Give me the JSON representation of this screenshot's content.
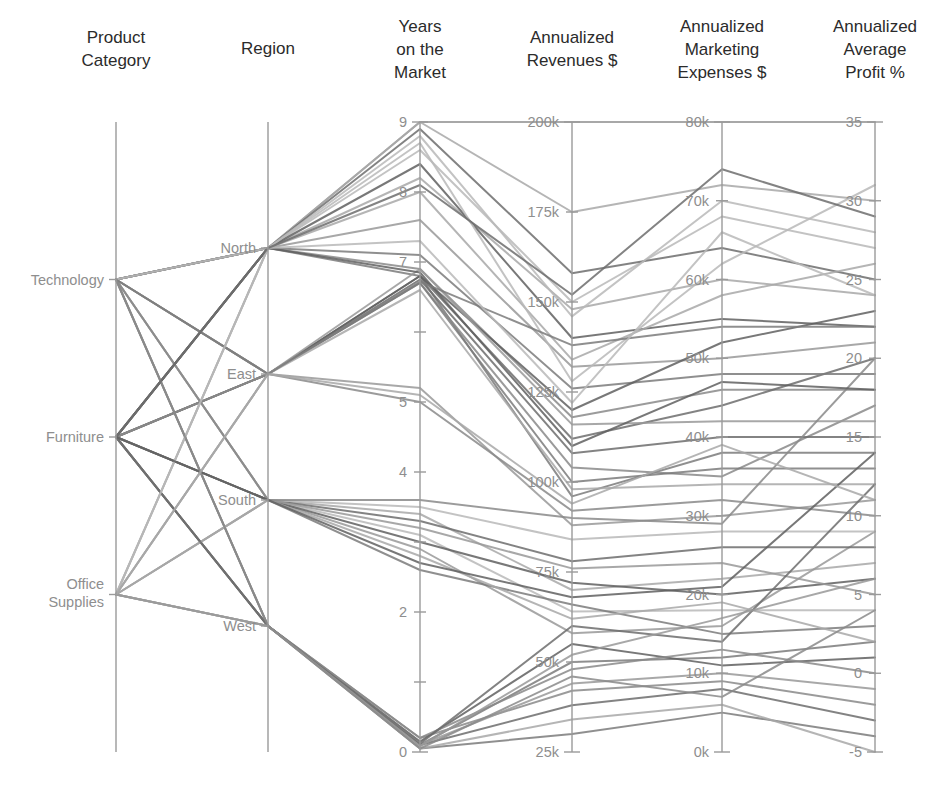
{
  "figure": {
    "type": "parallel-coordinates",
    "background": "#ffffff",
    "width": 935,
    "height": 794
  },
  "axes": [
    {
      "id": "product-category",
      "title_lines": [
        "Product",
        "Category"
      ],
      "scale": "categorical",
      "categories": [
        "Technology",
        "Furniture",
        "Office Supplies"
      ],
      "x": 116,
      "top": 122,
      "bottom": 752
    },
    {
      "id": "region",
      "title_lines": [
        "Region"
      ],
      "scale": "categorical",
      "categories": [
        "North",
        "East",
        "South",
        "West"
      ],
      "x": 268,
      "top": 122,
      "bottom": 752
    },
    {
      "id": "years-on-market",
      "title_lines": [
        "Years",
        "on the",
        "Market"
      ],
      "scale": "numeric",
      "min": 0,
      "max": 9,
      "ticks": [
        0,
        1,
        2,
        3,
        4,
        5,
        6,
        7,
        8,
        9
      ],
      "tick_labels": [
        "0",
        "",
        "2",
        "",
        "4",
        "5",
        "",
        "7",
        "8",
        "9"
      ],
      "x": 420,
      "top": 122,
      "bottom": 752
    },
    {
      "id": "annualized-revenues",
      "title_lines": [
        "Annualized",
        "Revenues $"
      ],
      "scale": "numeric",
      "min": 25000,
      "max": 200000,
      "ticks": [
        25000,
        50000,
        75000,
        100000,
        125000,
        150000,
        175000,
        200000
      ],
      "tick_labels": [
        "25k",
        "50k",
        "75k",
        "100k",
        "125k",
        "150k",
        "175k",
        "200k"
      ],
      "x": 572,
      "top": 122,
      "bottom": 752
    },
    {
      "id": "annualized-marketing-expenses",
      "title_lines": [
        "Annualized",
        "Marketing",
        "Expenses $"
      ],
      "scale": "numeric",
      "min": 0,
      "max": 80000,
      "ticks": [
        0,
        10000,
        20000,
        30000,
        40000,
        50000,
        60000,
        70000,
        80000
      ],
      "tick_labels": [
        "0k",
        "10k",
        "20k",
        "30k",
        "40k",
        "50k",
        "60k",
        "70k",
        "80k"
      ],
      "x": 722,
      "top": 122,
      "bottom": 752
    },
    {
      "id": "annualized-average-profit",
      "title_lines": [
        "Annualized",
        "Average",
        "Profit %"
      ],
      "scale": "numeric",
      "min": -5,
      "max": 35,
      "ticks": [
        -5,
        0,
        5,
        10,
        15,
        20,
        25,
        30,
        35
      ],
      "tick_labels": [
        "-5",
        "0",
        "5",
        "10",
        "15",
        "20",
        "25",
        "30",
        "35"
      ],
      "x": 875,
      "top": 122,
      "bottom": 752
    }
  ],
  "style": {
    "axis_color": "#9a9a9a",
    "tick_label_color": "#8e8e8e",
    "title_color": "#2b2b2b",
    "line_colors": [
      "#b8b8b8",
      "#a8a8a8",
      "#999999",
      "#8a8a8a",
      "#7b7b7b",
      "#6d6d6d",
      "#606060"
    ],
    "line_width": 2.0,
    "line_opacity": 0.85
  },
  "chart_data": {
    "type": "line",
    "title": "",
    "dimensions": [
      "Product Category",
      "Region",
      "Years on the Market",
      "Annualized Revenues $",
      "Annualized Marketing Expenses $",
      "Annualized Average Profit %"
    ],
    "categorical_domains": {
      "Product Category": [
        "Technology",
        "Furniture",
        "Office Supplies"
      ],
      "Region": [
        "North",
        "East",
        "South",
        "West"
      ]
    },
    "axis_ranges": {
      "Years on the Market": [
        0,
        9
      ],
      "Annualized Revenues $": [
        25000,
        200000
      ],
      "Annualized Marketing Expenses $": [
        0,
        80000
      ],
      "Annualized Average Profit %": [
        -5,
        35
      ]
    },
    "legend": "none",
    "grid": false,
    "records": [
      {
        "category": "Technology",
        "region": "North",
        "years": 9,
        "revenues": 200000,
        "marketing": 80000,
        "profit": 35,
        "shade": 2
      },
      {
        "category": "Technology",
        "region": "North",
        "years": 9,
        "revenues": 175000,
        "marketing": 72000,
        "profit": 30,
        "shade": 1
      },
      {
        "category": "Technology",
        "region": "North",
        "years": 8.6,
        "revenues": 150000,
        "marketing": 68000,
        "profit": 27,
        "shade": 0
      },
      {
        "category": "Technology",
        "region": "North",
        "years": 8.2,
        "revenues": 148000,
        "marketing": 60000,
        "profit": 24,
        "shade": 1
      },
      {
        "category": "Technology",
        "region": "North",
        "years": 7.6,
        "revenues": 132000,
        "marketing": 50000,
        "profit": 21,
        "shade": 2
      },
      {
        "category": "Technology",
        "region": "North",
        "years": 6.9,
        "revenues": 118000,
        "marketing": 46000,
        "profit": 18,
        "shade": 3
      },
      {
        "category": "Technology",
        "region": "North",
        "years": 6.8,
        "revenues": 96000,
        "marketing": 38000,
        "profit": 14,
        "shade": 4
      },
      {
        "category": "Technology",
        "region": "East",
        "years": 6.8,
        "revenues": 112000,
        "marketing": 44000,
        "profit": 20,
        "shade": 5
      },
      {
        "category": "Technology",
        "region": "East",
        "years": 6.7,
        "revenues": 104000,
        "marketing": 35000,
        "profit": 17,
        "shade": 3
      },
      {
        "category": "Technology",
        "region": "East",
        "years": 5.2,
        "revenues": 88000,
        "marketing": 30000,
        "profit": 11,
        "shade": 2
      },
      {
        "category": "Technology",
        "region": "South",
        "years": 3.4,
        "revenues": 70000,
        "marketing": 22000,
        "profit": 7,
        "shade": 1
      },
      {
        "category": "Technology",
        "region": "South",
        "years": 3.1,
        "revenues": 64000,
        "marketing": 18000,
        "profit": 4,
        "shade": 0
      },
      {
        "category": "Technology",
        "region": "South",
        "years": 2.9,
        "revenues": 58000,
        "marketing": 16000,
        "profit": 9,
        "shade": 2
      },
      {
        "category": "Technology",
        "region": "West",
        "years": 0.1,
        "revenues": 50000,
        "marketing": 12000,
        "profit": 2,
        "shade": 4
      },
      {
        "category": "Technology",
        "region": "West",
        "years": 0.2,
        "revenues": 42000,
        "marketing": 9000,
        "profit": -2,
        "shade": 3
      },
      {
        "category": "Furniture",
        "region": "North",
        "years": 8.9,
        "revenues": 158000,
        "marketing": 64000,
        "profit": 25,
        "shade": 5
      },
      {
        "category": "Furniture",
        "region": "North",
        "years": 8.4,
        "revenues": 140000,
        "marketing": 55000,
        "profit": 22,
        "shade": 6
      },
      {
        "category": "Furniture",
        "region": "North",
        "years": 7.1,
        "revenues": 126000,
        "marketing": 48000,
        "profit": 19,
        "shade": 4
      },
      {
        "category": "Furniture",
        "region": "East",
        "years": 6.8,
        "revenues": 120000,
        "marketing": 52000,
        "profit": 23,
        "shade": 6
      },
      {
        "category": "Furniture",
        "region": "East",
        "years": 6.75,
        "revenues": 108000,
        "marketing": 40000,
        "profit": 15,
        "shade": 5
      },
      {
        "category": "Furniture",
        "region": "East",
        "years": 6.7,
        "revenues": 100000,
        "marketing": 36000,
        "profit": 13,
        "shade": 4
      },
      {
        "category": "Furniture",
        "region": "East",
        "years": 5.0,
        "revenues": 92000,
        "marketing": 32000,
        "profit": 10,
        "shade": 3
      },
      {
        "category": "Furniture",
        "region": "South",
        "years": 3.3,
        "revenues": 78000,
        "marketing": 26000,
        "profit": 8,
        "shade": 5
      },
      {
        "category": "Furniture",
        "region": "South",
        "years": 3.0,
        "revenues": 72000,
        "marketing": 20000,
        "profit": 6,
        "shade": 6
      },
      {
        "category": "Furniture",
        "region": "South",
        "years": 2.6,
        "revenues": 66000,
        "marketing": 15000,
        "profit": 3,
        "shade": 4
      },
      {
        "category": "Furniture",
        "region": "West",
        "years": 0.15,
        "revenues": 55000,
        "marketing": 11000,
        "profit": 1,
        "shade": 6
      },
      {
        "category": "Furniture",
        "region": "West",
        "years": 0.1,
        "revenues": 38000,
        "marketing": 8000,
        "profit": -3,
        "shade": 5
      },
      {
        "category": "Furniture",
        "region": "West",
        "years": 0.05,
        "revenues": 30000,
        "marketing": 5000,
        "profit": -4,
        "shade": 4
      },
      {
        "category": "Office Supplies",
        "region": "North",
        "years": 8.8,
        "revenues": 146000,
        "marketing": 70000,
        "profit": 28,
        "shade": 0
      },
      {
        "category": "Office Supplies",
        "region": "North",
        "years": 8.0,
        "revenues": 134000,
        "marketing": 58000,
        "profit": 26,
        "shade": 1
      },
      {
        "category": "Office Supplies",
        "region": "East",
        "years": 6.9,
        "revenues": 116000,
        "marketing": 42000,
        "profit": 16,
        "shade": 2
      },
      {
        "category": "Office Supplies",
        "region": "East",
        "years": 6.6,
        "revenues": 98000,
        "marketing": 34000,
        "profit": 12,
        "shade": 1
      },
      {
        "category": "Office Supplies",
        "region": "South",
        "years": 3.5,
        "revenues": 84000,
        "marketing": 28000,
        "profit": 9,
        "shade": 0
      },
      {
        "category": "Office Supplies",
        "region": "South",
        "years": 3.2,
        "revenues": 76000,
        "marketing": 24000,
        "profit": 5,
        "shade": 2
      },
      {
        "category": "Office Supplies",
        "region": "South",
        "years": 2.8,
        "revenues": 62000,
        "marketing": 19000,
        "profit": 2,
        "shade": 1
      },
      {
        "category": "Office Supplies",
        "region": "West",
        "years": 0.2,
        "revenues": 48000,
        "marketing": 13000,
        "profit": 0,
        "shade": 3
      },
      {
        "category": "Office Supplies",
        "region": "West",
        "years": 0.1,
        "revenues": 44000,
        "marketing": 10000,
        "profit": -1,
        "shade": 2
      },
      {
        "category": "Office Supplies",
        "region": "West",
        "years": 0.05,
        "revenues": 34000,
        "marketing": 6000,
        "profit": -5,
        "shade": 1
      },
      {
        "category": "Technology",
        "region": "North",
        "years": 8.7,
        "revenues": 128000,
        "marketing": 62000,
        "profit": 31,
        "shade": 0
      },
      {
        "category": "Technology",
        "region": "South",
        "years": 3.6,
        "revenues": 90000,
        "marketing": 29000,
        "profit": 20,
        "shade": 3
      },
      {
        "category": "Furniture",
        "region": "North",
        "years": 6.85,
        "revenues": 110000,
        "marketing": 47000,
        "profit": 18,
        "shade": 6
      },
      {
        "category": "Furniture",
        "region": "West",
        "years": 0.12,
        "revenues": 60000,
        "marketing": 14000,
        "profit": 12,
        "shade": 5
      },
      {
        "category": "Office Supplies",
        "region": "West",
        "years": 0.08,
        "revenues": 52000,
        "marketing": 17000,
        "profit": 6,
        "shade": 2
      },
      {
        "category": "Technology",
        "region": "East",
        "years": 6.72,
        "revenues": 138000,
        "marketing": 54000,
        "profit": 22,
        "shade": 4
      },
      {
        "category": "Office Supplies",
        "region": "North",
        "years": 7.3,
        "revenues": 122000,
        "marketing": 66000,
        "profit": 24,
        "shade": 0
      },
      {
        "category": "Furniture",
        "region": "South",
        "years": 2.7,
        "revenues": 68000,
        "marketing": 21000,
        "profit": 14,
        "shade": 6
      },
      {
        "category": "Technology",
        "region": "West",
        "years": 0.05,
        "revenues": 46000,
        "marketing": 7000,
        "profit": 4,
        "shade": 3
      },
      {
        "category": "Office Supplies",
        "region": "East",
        "years": 5.1,
        "revenues": 94000,
        "marketing": 39000,
        "profit": 11,
        "shade": 1
      },
      {
        "category": "Furniture",
        "region": "North",
        "years": 8.1,
        "revenues": 152000,
        "marketing": 74000,
        "profit": 29,
        "shade": 5
      }
    ]
  }
}
